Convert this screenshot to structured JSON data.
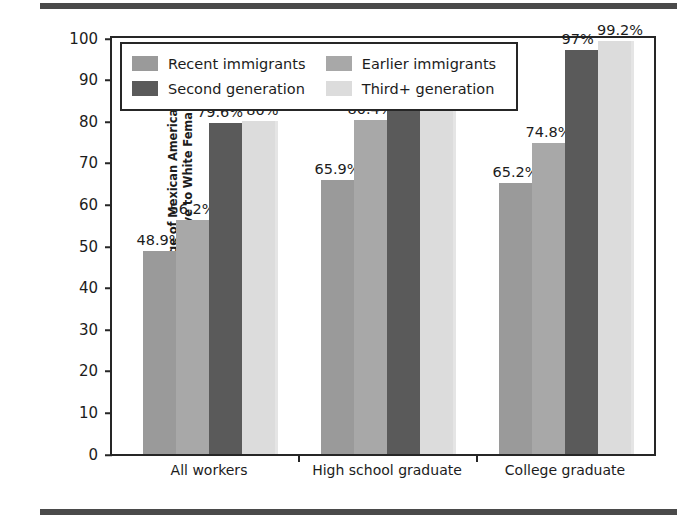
{
  "chart_data": {
    "type": "bar",
    "title": "",
    "xlabel": "",
    "ylabel_lines": [
      "Percentage of Mexican American Female",
      "Wages Relative to White Female Wages"
    ],
    "categories": [
      "All workers",
      "High school graduate",
      "College graduate"
    ],
    "series": [
      {
        "name": "Recent immigrants",
        "color": "#9a9a9a",
        "values": [
          48.9,
          65.9,
          65.2
        ],
        "labels": [
          "48.9%",
          "65.9%",
          "65.2%"
        ]
      },
      {
        "name": "Earlier immigrants",
        "color": "#a8a8a8",
        "values": [
          56.2,
          80.4,
          74.8
        ],
        "labels": [
          "56.2%",
          "80.4%",
          "74.8%"
        ]
      },
      {
        "name": "Second generation",
        "color": "#5a5a5a",
        "values": [
          79.6,
          88.2,
          97.0
        ],
        "labels": [
          "79.6%",
          "88.2%",
          "97%"
        ]
      },
      {
        "name": "Third+ generation",
        "color": "#dcdcdc",
        "values": [
          80.0,
          90.1,
          99.2
        ],
        "labels": [
          "80%",
          "90.1%",
          "99.2%"
        ]
      }
    ],
    "ylim": [
      0,
      100
    ],
    "yticks": [
      0,
      10,
      20,
      30,
      40,
      50,
      60,
      70,
      80,
      90,
      100
    ],
    "ytick_labels": [
      "0",
      "10",
      "20",
      "30",
      "40",
      "50",
      "60",
      "70",
      "80",
      "90",
      "100"
    ],
    "grid": false,
    "legend_position": "upper-left-inside",
    "frame_color": "#262626"
  },
  "legend": {
    "entries": [
      {
        "label": "Recent immigrants",
        "color": "#9a9a9a"
      },
      {
        "label": "Earlier immigrants",
        "color": "#a8a8a8"
      },
      {
        "label": "Second generation",
        "color": "#5a5a5a"
      },
      {
        "label": "Third+ generation",
        "color": "#dcdcdc"
      }
    ]
  }
}
